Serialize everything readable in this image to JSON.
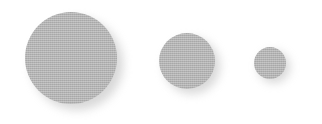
{
  "canvas": {
    "width": 322,
    "height": 124,
    "background_color": "#ffffff",
    "description": "Three grey halftone-textured circles of decreasing size, left to right, each with a soft drop shadow offset down and to the right, on a plain white background."
  },
  "style": {
    "disc_color": "#c6c6c6",
    "shadow_color": "#b9b9b9",
    "shadow_opacity": 0.55,
    "shadow_blur_px": 5,
    "texture": "halftone-dither"
  },
  "shapes": [
    {
      "name": "large-circle",
      "label": "Large circle",
      "diameter": 92,
      "left": 25,
      "top": 12,
      "center_x": 71,
      "center_y": 58,
      "shadow_offset_x": 6,
      "shadow_offset_y": 6
    },
    {
      "name": "medium-circle",
      "label": "Medium circle",
      "diameter": 56,
      "left": 159,
      "top": 33,
      "center_x": 187,
      "center_y": 61,
      "shadow_offset_x": 5,
      "shadow_offset_y": 5
    },
    {
      "name": "small-circle",
      "label": "Small circle",
      "diameter": 32,
      "left": 254,
      "top": 47,
      "center_x": 270,
      "center_y": 63,
      "shadow_offset_x": 4,
      "shadow_offset_y": 4
    }
  ]
}
